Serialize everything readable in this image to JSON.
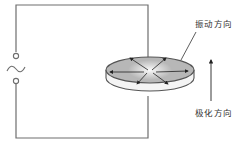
{
  "diagram": {
    "labels": {
      "vibration_direction": "振动方向",
      "polarization_direction": "极化方向"
    },
    "source": {
      "symbol": "~",
      "type": "AC source"
    },
    "colors": {
      "wire": "#6e6e6e",
      "disc_fill": "#b8b8b8",
      "disc_edge": "#555555",
      "text": "#333333",
      "background": "#ffffff"
    }
  }
}
